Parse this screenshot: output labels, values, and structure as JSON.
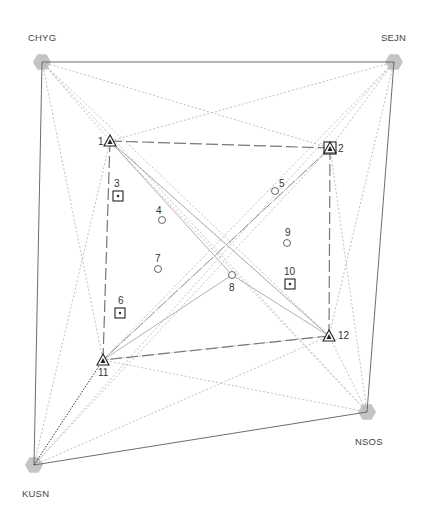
{
  "diagram": {
    "type": "survey-network",
    "colors": {
      "frame_line": "#6e6e6e",
      "sight_line": "#b0b0b0",
      "dashed_loop": "#777777",
      "control_hex": "#c4c4c4",
      "marker": "#222222",
      "highlight_line": "#333333"
    },
    "control_stations": [
      {
        "id": "CHYG",
        "label": "CHYG",
        "x": 42,
        "y": 62,
        "label_x": 28,
        "label_y": 33
      },
      {
        "id": "SEJN",
        "label": "SEJN",
        "x": 394,
        "y": 62,
        "label_x": 381,
        "label_y": 33
      },
      {
        "id": "NSOS",
        "label": "NSOS",
        "x": 367,
        "y": 412,
        "label_x": 355,
        "label_y": 437
      },
      {
        "id": "KUSN",
        "label": "KUSN",
        "x": 34,
        "y": 465,
        "label_x": 22,
        "label_y": 489
      }
    ],
    "points": [
      {
        "id": "1",
        "label": "1",
        "symbol": "triangle",
        "x": 110,
        "y": 141,
        "label_dx": -12,
        "label_dy": -4
      },
      {
        "id": "2",
        "label": "2",
        "symbol": "triangle-in-square",
        "x": 330,
        "y": 148,
        "label_dx": 8,
        "label_dy": -4
      },
      {
        "id": "3",
        "label": "3",
        "symbol": "square-dot",
        "x": 118,
        "y": 196,
        "label_dx": -4,
        "label_dy": -17
      },
      {
        "id": "4",
        "label": "4",
        "symbol": "circle",
        "x": 162,
        "y": 220,
        "label_dx": -6,
        "label_dy": -14
      },
      {
        "id": "5",
        "label": "5",
        "symbol": "circle",
        "x": 275,
        "y": 191,
        "label_dx": 4,
        "label_dy": -12
      },
      {
        "id": "6",
        "label": "6",
        "symbol": "square-dot",
        "x": 120,
        "y": 313,
        "label_dx": -2,
        "label_dy": -17
      },
      {
        "id": "7",
        "label": "7",
        "symbol": "circle",
        "x": 158,
        "y": 269,
        "label_dx": -3,
        "label_dy": -15
      },
      {
        "id": "8",
        "label": "8",
        "symbol": "circle",
        "x": 232,
        "y": 275,
        "label_dx": -3,
        "label_dy": 8
      },
      {
        "id": "9",
        "label": "9",
        "symbol": "circle",
        "x": 287,
        "y": 243,
        "label_dx": -2,
        "label_dy": -15
      },
      {
        "id": "10",
        "label": "10",
        "symbol": "square-dot",
        "x": 290,
        "y": 284,
        "label_dx": -6,
        "label_dy": -17
      },
      {
        "id": "11",
        "label": "11",
        "symbol": "triangle",
        "x": 103,
        "y": 360,
        "label_dx": -5,
        "label_dy": 8
      },
      {
        "id": "12",
        "label": "12",
        "symbol": "triangle",
        "x": 329,
        "y": 336,
        "label_dx": 9,
        "label_dy": -5
      }
    ],
    "frame_edges": [
      [
        "CHYG",
        "SEJN"
      ],
      [
        "SEJN",
        "NSOS"
      ],
      [
        "NSOS",
        "KUSN"
      ],
      [
        "KUSN",
        "CHYG"
      ]
    ],
    "loop_edges": [
      [
        "1",
        "2"
      ],
      [
        "2",
        "12"
      ],
      [
        "12",
        "11"
      ],
      [
        "11",
        "1"
      ],
      [
        "2",
        "11"
      ]
    ],
    "solid_gray_edges": [
      [
        "1",
        "8"
      ],
      [
        "8",
        "12"
      ],
      [
        "11",
        "8"
      ],
      [
        "1",
        "12"
      ]
    ],
    "highlight_edges": [
      [
        "KUSN",
        "11"
      ]
    ],
    "sight_edges": [
      [
        "CHYG",
        "1"
      ],
      [
        "CHYG",
        "2"
      ],
      [
        "CHYG",
        "11"
      ],
      [
        "CHYG",
        "12"
      ],
      [
        "CHYG",
        "NSOS"
      ],
      [
        "SEJN",
        "1"
      ],
      [
        "SEJN",
        "2"
      ],
      [
        "SEJN",
        "11"
      ],
      [
        "SEJN",
        "12"
      ],
      [
        "SEJN",
        "KUSN"
      ],
      [
        "NSOS",
        "1"
      ],
      [
        "NSOS",
        "2"
      ],
      [
        "NSOS",
        "11"
      ],
      [
        "NSOS",
        "12"
      ],
      [
        "KUSN",
        "1"
      ],
      [
        "KUSN",
        "2"
      ],
      [
        "KUSN",
        "12"
      ],
      [
        "11",
        "2"
      ],
      [
        "11",
        "12"
      ],
      [
        "1",
        "12"
      ],
      [
        "2",
        "11"
      ]
    ]
  }
}
